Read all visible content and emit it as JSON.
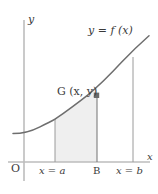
{
  "figure": {
    "kind": "calculus-area-under-curve-diagram",
    "axes": {
      "y_axis_label": "y",
      "x_axis_label": "x",
      "origin_label": "O"
    },
    "labels": {
      "curve_label": "y = f (x)",
      "point_label": "G (x, y)",
      "left_bound_label": "x = a",
      "mid_bound_label": "B",
      "right_bound_label": "x = b"
    },
    "colors": {
      "ink": "#3a3a3a",
      "axis": "#b9b9b9",
      "curve": "#6b6b6b",
      "shade_fill": "#efefef",
      "shade_stroke": "#8c8c8c",
      "marker": "#6b6b6b",
      "background": "#ffffff"
    }
  },
  "chart_data": {
    "type": "line",
    "title": "",
    "xlabel": "x",
    "ylabel": "y",
    "grid": false,
    "legend": null,
    "series": [
      {
        "name": "y = f (x)",
        "x": [
          14,
          24,
          34,
          44,
          55,
          66,
          77,
          86,
          97,
          110,
          122,
          133,
          148
        ],
        "y": [
          133,
          132,
          129,
          125,
          119,
          112,
          104,
          97,
          88,
          77,
          66,
          57,
          44
        ]
      }
    ],
    "annotations": [
      {
        "text": "y = f (x)",
        "x": 118,
        "y": 31
      },
      {
        "text": "G (x, y)",
        "x": 73,
        "y": 92
      },
      {
        "text": "x = a",
        "x": 50,
        "y": 171
      },
      {
        "text": "B",
        "x": 97,
        "y": 171
      },
      {
        "text": "x = b",
        "x": 128,
        "y": 171
      },
      {
        "text": "O",
        "x": 15,
        "y": 169
      }
    ],
    "markers": [
      {
        "label": "G (x, y)",
        "x": 97,
        "y": 97,
        "shape": "square"
      }
    ],
    "vertical_lines": [
      {
        "label": "x = a",
        "x": 55,
        "from_y": 162,
        "to_y": 119
      },
      {
        "label": "B",
        "x": 97,
        "from_y": 162,
        "to_y": 97
      },
      {
        "label": "x = b",
        "x": 133,
        "from_y": 162,
        "to_y": 57
      }
    ],
    "shaded_region": {
      "from_label": "x = a",
      "to_label": "B",
      "fill": "#efefef",
      "description": "area under curve between x = a and B"
    },
    "axis_extent": {
      "x_axis_y": 162,
      "x_from": 8,
      "x_to": 148,
      "y_axis_x": 24,
      "y_from": 20,
      "y_to": 181
    }
  }
}
